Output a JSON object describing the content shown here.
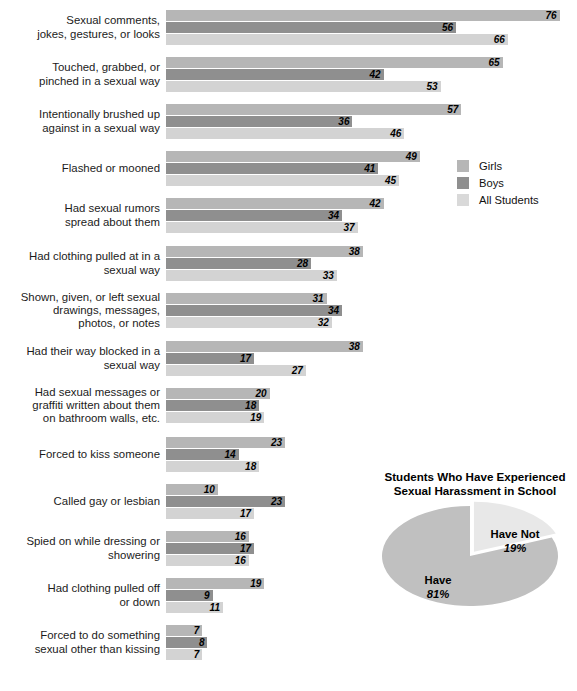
{
  "chart_data": {
    "type": "bar",
    "orientation": "horizontal",
    "title": "",
    "xlabel": "",
    "ylabel": "",
    "xlim": [
      0,
      80
    ],
    "grid": false,
    "legend_position": "middle-right",
    "value_unit": "percent",
    "categories": [
      "Sexual comments, jokes, gestures, or looks",
      "Touched, grabbed, or pinched in a sexual way",
      "Intentionally brushed up against in a sexual way",
      "Flashed or mooned",
      "Had sexual rumors spread about them",
      "Had clothing pulled at in a sexual way",
      "Shown, given, or left sexual drawings, messages, photos, or notes",
      "Had their way blocked in a sexual way",
      "Had sexual messages or graffiti written about them on bathroom walls, etc.",
      "Forced to kiss someone",
      "Called gay or lesbian",
      "Spied on while dressing or showering",
      "Had clothing pulled off or down",
      "Forced to do something sexual other than kissing"
    ],
    "series": [
      {
        "name": "Girls",
        "color": "#b6b6b6",
        "values": [
          76,
          65,
          57,
          49,
          42,
          38,
          31,
          38,
          20,
          23,
          10,
          16,
          19,
          7
        ]
      },
      {
        "name": "Boys",
        "color": "#8f8f8f",
        "values": [
          56,
          42,
          36,
          41,
          34,
          28,
          34,
          17,
          18,
          14,
          23,
          17,
          9,
          8
        ]
      },
      {
        "name": "All Students",
        "color": "#d3d3d3",
        "values": [
          66,
          53,
          46,
          45,
          37,
          33,
          32,
          27,
          19,
          18,
          17,
          16,
          11,
          7
        ]
      }
    ]
  },
  "rows": [
    {
      "label_lines": [
        "Sexual comments,",
        "jokes, gestures, or looks"
      ],
      "girls": 76,
      "boys": 56,
      "all": 66
    },
    {
      "label_lines": [
        "Touched, grabbed, or",
        "pinched in a sexual way"
      ],
      "girls": 65,
      "boys": 42,
      "all": 53
    },
    {
      "label_lines": [
        "Intentionally brushed up",
        "against in a sexual way"
      ],
      "girls": 57,
      "boys": 36,
      "all": 46
    },
    {
      "label_lines": [
        "Flashed or mooned"
      ],
      "girls": 49,
      "boys": 41,
      "all": 45
    },
    {
      "label_lines": [
        "Had sexual rumors",
        "spread about them"
      ],
      "girls": 42,
      "boys": 34,
      "all": 37
    },
    {
      "label_lines": [
        "Had clothing pulled at in a",
        "sexual way"
      ],
      "girls": 38,
      "boys": 28,
      "all": 33
    },
    {
      "label_lines": [
        "Shown, given, or left sexual",
        "drawings, messages,",
        "photos, or notes"
      ],
      "girls": 31,
      "boys": 34,
      "all": 32
    },
    {
      "label_lines": [
        "Had their way blocked in a",
        "sexual way"
      ],
      "girls": 38,
      "boys": 17,
      "all": 27
    },
    {
      "label_lines": [
        "Had sexual messages or",
        "graffiti written about them",
        "on bathroom walls, etc."
      ],
      "girls": 20,
      "boys": 18,
      "all": 19
    },
    {
      "label_lines": [
        "Forced to kiss someone"
      ],
      "girls": 23,
      "boys": 14,
      "all": 18
    },
    {
      "label_lines": [
        "Called gay or lesbian"
      ],
      "girls": 10,
      "boys": 23,
      "all": 17
    },
    {
      "label_lines": [
        "Spied on while dressing or",
        "showering"
      ],
      "girls": 16,
      "boys": 17,
      "all": 16
    },
    {
      "label_lines": [
        "Had clothing pulled off",
        "or down"
      ],
      "girls": 19,
      "boys": 9,
      "all": 11
    },
    {
      "label_lines": [
        "Forced to do something",
        "sexual other than kissing"
      ],
      "girls": 7,
      "boys": 8,
      "all": 7
    }
  ],
  "legend": {
    "items": [
      {
        "label": "Girls",
        "swatch_class": "girls",
        "color": "#b6b6b6"
      },
      {
        "label": "Boys",
        "swatch_class": "boys",
        "color": "#8f8f8f"
      },
      {
        "label": "All Students",
        "swatch_class": "all",
        "color": "#d9d9d9"
      }
    ]
  },
  "footer_legend": {
    "label": "Girls"
  },
  "pie": {
    "title_lines": [
      "Students Who Have Experienced",
      "Sexual Harassment in School"
    ],
    "title": "Students Who Have Experienced Sexual Harassment in School",
    "slices": [
      {
        "name": "Have",
        "pct_label": "81%",
        "value": 81,
        "color": "#c0c0c0"
      },
      {
        "name": "Have Not",
        "pct_label": "19%",
        "value": 19,
        "color": "#e8e8e8"
      }
    ]
  }
}
